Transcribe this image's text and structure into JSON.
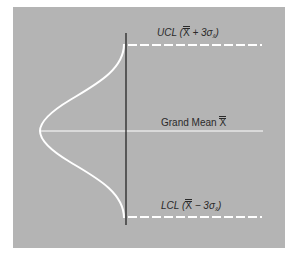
{
  "diagram": {
    "type": "control-chart",
    "background_color": "#b4b4b4",
    "line_color": "#ffffff",
    "axis_color": "#1a1a1a",
    "labels": {
      "ucl": {
        "prefix": "UCL (",
        "xbar": "X",
        "op": " + 3σ",
        "sub": "x̄",
        "suffix": ")"
      },
      "mean": {
        "prefix": "Grand Mean ",
        "xbar": "X"
      },
      "lcl": {
        "prefix": "LCL (",
        "xbar": "X",
        "op": " − 3σ",
        "sub": "x̄",
        "suffix": ")"
      }
    },
    "elements": [
      "normal-distribution-curve",
      "vertical-axis",
      "ucl-dashed-line",
      "grand-mean-line",
      "lcl-dashed-line"
    ]
  }
}
